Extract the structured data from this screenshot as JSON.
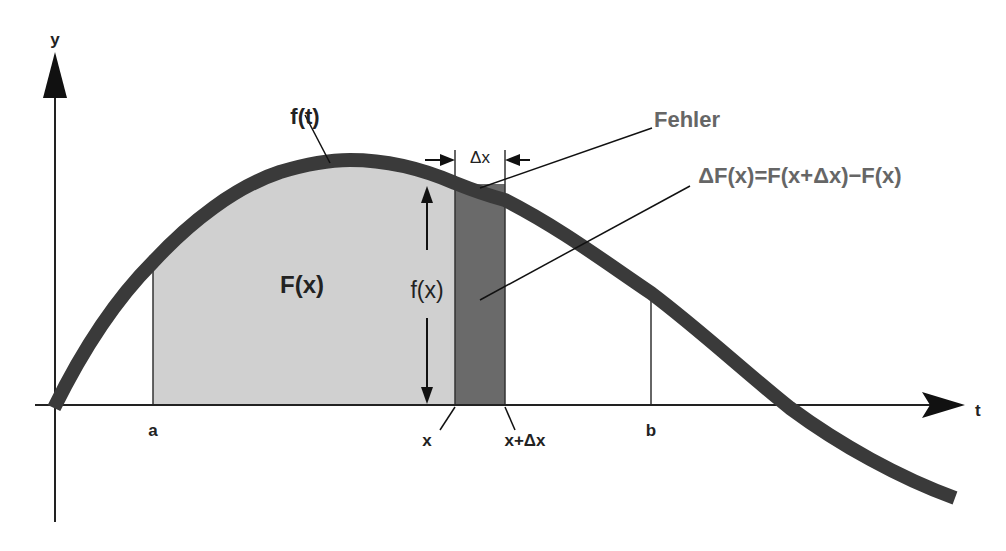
{
  "diagram": {
    "type": "integral-area-illustration",
    "axes": {
      "x_label": "t",
      "y_label": "y"
    },
    "curve": {
      "label": "f(t)",
      "color": "#333333"
    },
    "area": {
      "label": "F(x)",
      "color": "#d0d0d0"
    },
    "strip": {
      "label_height": "f(x)",
      "label_width": "Δx",
      "color": "#6a6a6a"
    },
    "annotations": {
      "error": "Fehler",
      "delta_F": "ΔF(x)=F(x+Δx)−F(x)"
    },
    "ticks": {
      "a": "a",
      "x": "x",
      "x_plus_dx": "x+Δx",
      "b": "b"
    },
    "colors": {
      "axis": "#222222",
      "annotation_text": "#666666"
    }
  }
}
